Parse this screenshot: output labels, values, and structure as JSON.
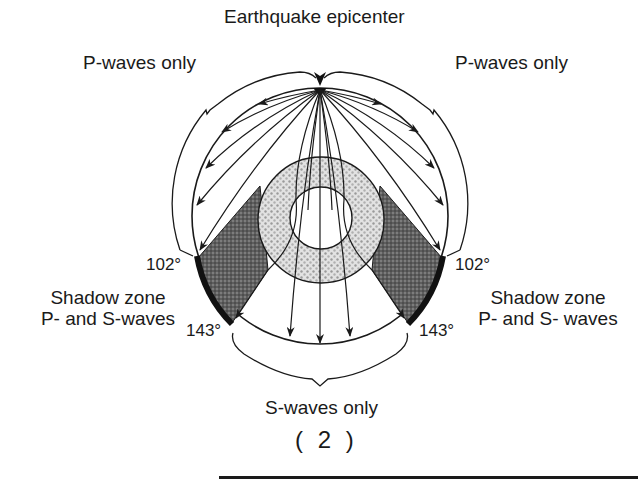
{
  "diagram": {
    "title": "Earthquake epicenter",
    "labels": {
      "p_waves_left": "P-waves only",
      "p_waves_right": "P-waves only",
      "deg_102_left": "102°",
      "deg_102_right": "102°",
      "deg_143_left": "143°",
      "deg_143_right": "143°",
      "shadow_left_line1": "Shadow zone",
      "shadow_left_line2": "P- and S-waves",
      "shadow_right_line1": "Shadow zone",
      "shadow_right_line2": "P- and S- waves",
      "s_waves": "S-waves only"
    },
    "figure_number": "( 2 )",
    "colors": {
      "ink": "#1a1a1a",
      "shadow_fill": "#6a6a6a",
      "outer_core_fill": "#d4d4d4",
      "background": "#ffffff"
    }
  }
}
